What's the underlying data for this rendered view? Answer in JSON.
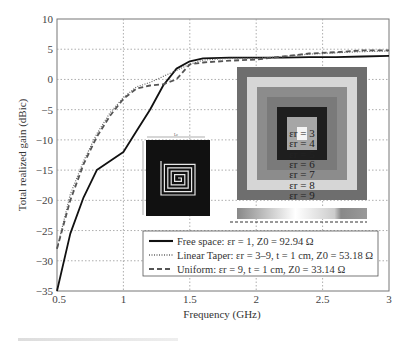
{
  "chart_data": {
    "type": "line",
    "title": "",
    "xlabel": "Frequency (GHz)",
    "ylabel": "Total realized gain (dBic)",
    "xlim": [
      0.5,
      3
    ],
    "ylim": [
      -35,
      10
    ],
    "xticks": [
      "0.5",
      "1",
      "1.5",
      "2",
      "2.5",
      "3"
    ],
    "yticks": [
      "10",
      "5",
      "0",
      "-5",
      "-10",
      "-15",
      "-20",
      "-25",
      "-30",
      "-35"
    ],
    "grid": true,
    "legend_position": "lower right",
    "x": [
      0.5,
      0.6,
      0.7,
      0.8,
      0.9,
      1.0,
      1.1,
      1.2,
      1.3,
      1.4,
      1.5,
      1.6,
      1.8,
      2.0,
      2.2,
      2.4,
      2.6,
      2.8,
      3.0
    ],
    "series": [
      {
        "name": "Free space: εr = 1, Z0 = 92.94 Ω",
        "style": "solid",
        "values": [
          -35,
          -25.5,
          -19.5,
          -15,
          -13.5,
          -12,
          -8.5,
          -5,
          -1,
          1.8,
          3,
          3.5,
          3.6,
          3.6,
          3.6,
          3.7,
          3.7,
          3.8,
          3.9
        ]
      },
      {
        "name": "Linear Taper: εr = 3–9, t = 1 cm, Z0 = 53.18 Ω",
        "style": "dotted",
        "values": [
          -28,
          -19,
          -13.5,
          -9,
          -5.5,
          -3,
          -1.2,
          -0.5,
          0.5,
          1.5,
          2.5,
          3.2,
          3.5,
          3.5,
          3.8,
          4.2,
          4.4,
          4.6,
          4.7
        ]
      },
      {
        "name": "Uniform: εr = 9, t = 1 cm, Z0 = 33.14 Ω",
        "style": "dashed",
        "values": [
          -28,
          -20,
          -14,
          -9.5,
          -6,
          -3.2,
          -1.5,
          -1,
          -0.8,
          0,
          2.5,
          2.8,
          3.1,
          3.3,
          3.8,
          4.3,
          4.5,
          4.8,
          4.8
        ]
      }
    ],
    "annotations": [
      "εr = 3",
      "εr = 4",
      "εr = 5",
      "εr = 6",
      "εr = 7",
      "εr = 8",
      "εr = 9"
    ]
  },
  "legend": {
    "items": [
      {
        "label": "Free space: εr = 1, Z0 = 92.94 Ω",
        "style": "solid"
      },
      {
        "label": "Linear Taper: εr = 3–9, t = 1 cm, Z0 = 53.18 Ω",
        "style": "dotted"
      },
      {
        "label": "Uniform: εr = 9, t = 1 cm, Z0 = 33.14 Ω",
        "style": "dashed"
      }
    ]
  },
  "inset": {
    "labels": [
      "εr = 3",
      "εr = 4",
      "εr = 5",
      "εr = 6",
      "εr = 7",
      "εr = 8",
      "εr = 9"
    ],
    "ring_colors": [
      "#6e6e6e",
      "#d6d6d6",
      "#8c8c8c",
      "#7a7a7a",
      "#1e1e1e",
      "#a6a6a6",
      "#f4f4f4"
    ],
    "spiral_dimension_label_top": "Lc",
    "spiral_dimension_label_side": "Ls"
  }
}
